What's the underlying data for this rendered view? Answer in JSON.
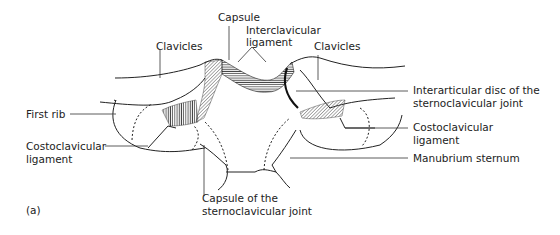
{
  "figure": {
    "panel_label": "(a)",
    "colors": {
      "line": "#222222",
      "background": "#ffffff"
    }
  },
  "labels": {
    "capsule": "Capsule",
    "interclavicular_1": "Interclavicular",
    "interclavicular_2": "ligament",
    "clavicles_left": "Clavicles",
    "clavicles_right": "Clavicles",
    "first_rib": "First rib",
    "disc_1": "Interarticular disc of the",
    "disc_2": "sternoclavicular joint",
    "costo_left_1": "Costoclavicular",
    "costo_left_2": "ligament",
    "costo_right_1": "Costoclavicular",
    "costo_right_2": "ligament",
    "manubrium": "Manubrium sternum",
    "capsule_joint_1": "Capsule of the",
    "capsule_joint_2": "sternoclavicular joint"
  }
}
